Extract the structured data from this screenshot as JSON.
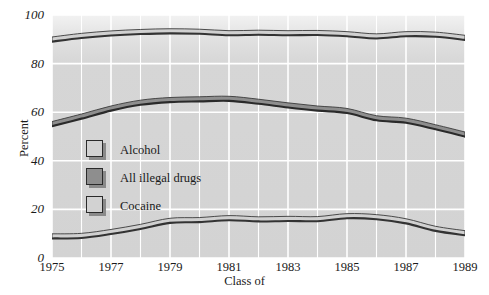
{
  "chart_data": {
    "type": "line",
    "title": "",
    "xlabel": "Class of",
    "ylabel": "Percent",
    "x": [
      1975,
      1976,
      1977,
      1978,
      1979,
      1980,
      1981,
      1982,
      1983,
      1984,
      1985,
      1986,
      1987,
      1988,
      1989
    ],
    "xlim": [
      1975,
      1989
    ],
    "ylim": [
      0,
      100
    ],
    "xticks": [
      "1975",
      "1977",
      "1979",
      "1981",
      "1983",
      "1985",
      "1987",
      "1989"
    ],
    "yticks": [
      "0",
      "20",
      "40",
      "60",
      "80",
      "100"
    ],
    "grid": "white gridlines, vertical every year, horizontal every 20 percent",
    "legend_position": "inside lower-left of plot area",
    "series": [
      {
        "name": "Alcohol",
        "color": "#d0d0d0",
        "edge_color": "#333333",
        "values": [
          90,
          91.5,
          92.5,
          93.1,
          93.4,
          93.2,
          92.6,
          92.8,
          92.6,
          92.7,
          92.2,
          91.3,
          92.2,
          92,
          90.7
        ]
      },
      {
        "name": "All illegal drugs",
        "color": "#8e8e8e",
        "edge_color": "#2a2a2a",
        "values": [
          55.2,
          58.3,
          61.6,
          64,
          65.1,
          65.4,
          65.6,
          64.4,
          62.9,
          61.6,
          60.6,
          57.6,
          56.6,
          53.9,
          50.9
        ]
      },
      {
        "name": "Cocaine",
        "color": "#d0d0d0",
        "edge_color": "#333333",
        "values": [
          9,
          9.2,
          10.8,
          12.9,
          15.4,
          15.7,
          16.5,
          16,
          16.2,
          16.1,
          17.3,
          16.9,
          15.2,
          12.1,
          10.3
        ]
      }
    ]
  },
  "axes": {
    "y_title": "Percent",
    "x_title": "Class of",
    "y_tick_labels": [
      "100",
      "80",
      "60",
      "40",
      "20",
      "0"
    ],
    "x_tick_labels": [
      "1975",
      "1977",
      "1979",
      "1981",
      "1983",
      "1985",
      "1987",
      "1989"
    ]
  },
  "legend": {
    "items": [
      {
        "label": "Alcohol",
        "swatch_color": "#d2d2d2"
      },
      {
        "label": "All illegal drugs",
        "swatch_color": "#8e8e8e"
      },
      {
        "label": "Cocaine",
        "swatch_color": "#d2d2d2"
      }
    ]
  },
  "colors": {
    "plot_background": "#d3d3d3",
    "grid": "#ffffff",
    "page_background": "#ffffff",
    "text": "#1a1a1a"
  }
}
